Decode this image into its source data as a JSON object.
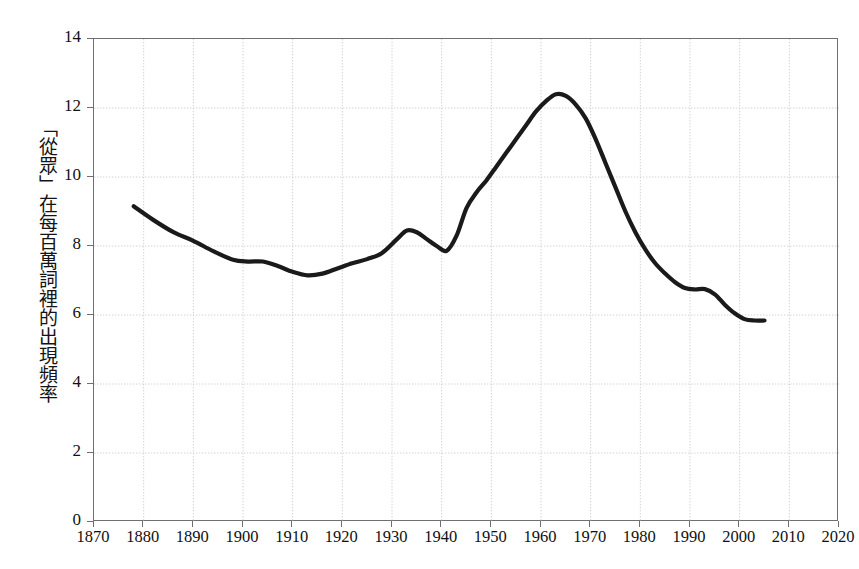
{
  "chart": {
    "title": "",
    "y_axis_label": "「從眾」在每百萬詞裡的出現頻率",
    "x_axis_label": "",
    "line_color": "#1a1a1a",
    "grid_color": "#d2d2d2",
    "axis_color": "#6f6f6f"
  },
  "chart_data": {
    "type": "line",
    "title": "",
    "xlabel": "",
    "ylabel": "「從眾」在每百萬詞裡的出現頻率",
    "xlim": [
      1870,
      2020
    ],
    "ylim": [
      0,
      14
    ],
    "xticks": [
      1870,
      1880,
      1890,
      1900,
      1910,
      1920,
      1930,
      1940,
      1950,
      1960,
      1970,
      1980,
      1990,
      2000,
      2010,
      2020
    ],
    "yticks": [
      0,
      2,
      4,
      6,
      8,
      10,
      12,
      14
    ],
    "xtick_labels": [
      "1870",
      "1880",
      "1890",
      "1900",
      "1910",
      "1920",
      "1930",
      "1940",
      "1950",
      "1960",
      "1970",
      "1980",
      "1990",
      "2000",
      "2010",
      "2020"
    ],
    "ytick_labels": [
      "0",
      "2",
      "4",
      "6",
      "8",
      "10",
      "12",
      "14"
    ],
    "grid": true,
    "legend": null,
    "series": [
      {
        "name": "「從眾」詞頻",
        "color": "#1a1a1a",
        "x": [
          1878,
          1882,
          1886,
          1890,
          1894,
          1898,
          1901,
          1904,
          1907,
          1910,
          1913,
          1916,
          1919,
          1922,
          1925,
          1928,
          1931,
          1933,
          1935,
          1937,
          1939,
          1941,
          1943,
          1945,
          1947,
          1949,
          1951,
          1953,
          1955,
          1957,
          1959,
          1961,
          1963,
          1965,
          1967,
          1969,
          1971,
          1973,
          1975,
          1977,
          1979,
          1981,
          1983,
          1985,
          1987,
          1989,
          1991,
          1993,
          1995,
          1997,
          1999,
          2001,
          2003,
          2005
        ],
        "y": [
          9.15,
          8.75,
          8.4,
          8.15,
          7.85,
          7.6,
          7.55,
          7.55,
          7.42,
          7.25,
          7.15,
          7.2,
          7.35,
          7.5,
          7.62,
          7.8,
          8.2,
          8.45,
          8.4,
          8.2,
          8.0,
          7.86,
          8.3,
          9.1,
          9.55,
          9.9,
          10.3,
          10.7,
          11.1,
          11.5,
          11.9,
          12.2,
          12.4,
          12.35,
          12.1,
          11.7,
          11.1,
          10.4,
          9.7,
          9.0,
          8.4,
          7.9,
          7.5,
          7.2,
          6.95,
          6.78,
          6.74,
          6.75,
          6.6,
          6.3,
          6.05,
          5.88,
          5.84,
          5.84
        ]
      }
    ],
    "annotations": [],
    "notable_points": [
      {
        "label": "起始值",
        "x": 1878,
        "y": 9.15
      },
      {
        "label": "早期低點",
        "x": 1913,
        "y": 7.15
      },
      {
        "label": "戰前局部高點",
        "x": 1933,
        "y": 8.45
      },
      {
        "label": "戰時低點",
        "x": 1941,
        "y": 7.86
      },
      {
        "label": "高峰",
        "x": 1963,
        "y": 12.4
      },
      {
        "label": "平台",
        "x": 1991,
        "y": 6.74
      },
      {
        "label": "結束值",
        "x": 2005,
        "y": 5.84
      }
    ]
  }
}
